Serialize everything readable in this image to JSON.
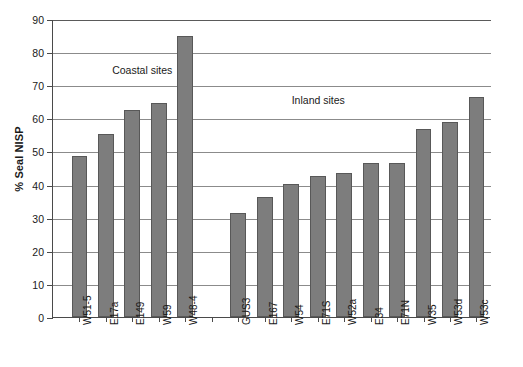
{
  "chart_data": {
    "type": "bar",
    "title": "",
    "xlabel": "",
    "ylabel": "% Seal NISP",
    "ylim": [
      0,
      90
    ],
    "ytick_step": 10,
    "yticks": [
      0,
      10,
      20,
      30,
      40,
      50,
      60,
      70,
      80,
      90
    ],
    "grid": true,
    "legend": "none",
    "bar_color": "#7d7d7d",
    "bar_edge_color": "#585858",
    "axis_color": "#4a4a4a",
    "gridline_color": "#8b8b8b",
    "categories": [
      "W51-5",
      "E17a",
      "E149",
      "W59",
      "W48-4",
      "GUS3",
      "E167",
      "W54",
      "E71S",
      "W52a",
      "E34",
      "E71N",
      "W35",
      "W53d",
      "W53c"
    ],
    "values": [
      48.7,
      55.2,
      62.5,
      64.5,
      85.0,
      31.5,
      36.2,
      40.2,
      42.5,
      43.6,
      46.6,
      46.6,
      56.9,
      58.8,
      66.5
    ],
    "groups": [
      {
        "name": "Coastal sites",
        "annotation": "Coastal sites",
        "categories": [
          "W51-5",
          "E17a",
          "E149",
          "W59",
          "W48-4"
        ],
        "values": [
          48.7,
          55.2,
          62.5,
          64.5,
          85.0
        ]
      },
      {
        "name": "Inland sites",
        "annotation": "Inland sites",
        "categories": [
          "GUS3",
          "E167",
          "W54",
          "E71S",
          "W52a",
          "E34",
          "E71N",
          "W35",
          "W53d",
          "W53c"
        ],
        "values": [
          31.5,
          36.2,
          40.2,
          42.5,
          43.6,
          46.6,
          46.6,
          56.9,
          58.8,
          66.5
        ]
      }
    ],
    "annotations": [
      {
        "text": "Coastal sites",
        "x_frac": 0.135,
        "y_value": 74.5
      },
      {
        "text": "Inland sites",
        "x_frac": 0.545,
        "y_value": 65.5
      }
    ],
    "group_gap_slots": 1
  }
}
